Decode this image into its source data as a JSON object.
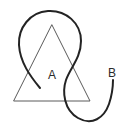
{
  "figure": {
    "background_color": "#ffffff",
    "width": 127,
    "height": 134
  },
  "shapes": {
    "triangle": {
      "name": "triangle-A",
      "stroke_color": "#5a5a5a",
      "stroke_width": 1,
      "apex": {
        "x": 52,
        "y": 25
      },
      "bottom_left": {
        "x": 14,
        "y": 101
      },
      "bottom_right": {
        "x": 90,
        "y": 101
      },
      "path": "M 52 25 L 90 101 L 14 101 Z"
    },
    "curve": {
      "name": "open-curve-B",
      "stroke_color": "#232323",
      "stroke_width": 2,
      "start_point": {
        "x": 40,
        "y": 88
      },
      "end_point": {
        "x": 113,
        "y": 80
      },
      "path": "M 40 88 C 30 76 20 62 19 45 C 18 28 30 12 48 11 C 66 10 81 23 81 41 C 81 58 70 68 66 80 C 62 92 64 110 78 118 C 92 126 104 118 109 104 C 113 92 113 85 113 80"
    }
  },
  "labels": [
    {
      "name": "label-A",
      "text": "A",
      "x": 52,
      "y": 79,
      "color": "#2b2b2b",
      "font_size": 12
    },
    {
      "name": "label-B",
      "text": "B",
      "x": 112,
      "y": 77,
      "color": "#2b2b2b",
      "font_size": 12
    }
  ]
}
